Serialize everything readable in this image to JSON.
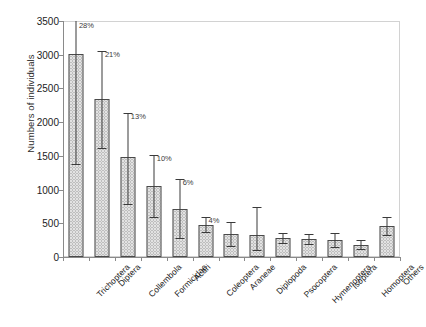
{
  "chart_data": {
    "type": "bar",
    "title": "",
    "xlabel": "",
    "ylabel": "Numbers of individuals",
    "ylim": [
      0,
      3500
    ],
    "ytick_labels": [
      "0",
      "500",
      "1000",
      "1500",
      "2000",
      "2500",
      "3000",
      "3500"
    ],
    "ytick_values": [
      0,
      500,
      1000,
      1500,
      2000,
      2500,
      3000,
      3500
    ],
    "grid": false,
    "legend": "none",
    "categories": [
      "Trichoptera",
      "Diptera",
      "Collembola",
      "Formicidae",
      "Acari",
      "Coleoptera",
      "Araneae",
      "Diplopoda",
      "Psocoptera",
      "Hymenoptera",
      "Isoptera",
      "Homoptera",
      "Others"
    ],
    "values": [
      3010,
      2340,
      1490,
      1050,
      710,
      480,
      340,
      320,
      280,
      265,
      250,
      175,
      455
    ],
    "error_low": [
      1380,
      1620,
      780,
      590,
      275,
      375,
      165,
      110,
      205,
      195,
      155,
      120,
      330
    ],
    "error_high": [
      3760,
      3060,
      2130,
      1520,
      1160,
      600,
      520,
      745,
      360,
      345,
      355,
      245,
      590
    ],
    "annotations": [
      {
        "category": "Trichoptera",
        "label": "28%"
      },
      {
        "category": "Diptera",
        "label": "21%"
      },
      {
        "category": "Collembola",
        "label": "13%"
      },
      {
        "category": "Formicidae",
        "label": "10%"
      },
      {
        "category": "Acari",
        "label": "6%"
      },
      {
        "category": "Coleoptera",
        "label": "4%"
      }
    ],
    "colors": {
      "bar_fill": "#e2e2e2",
      "bar_pattern": "#9a9a9a",
      "bar_edge": "#4a4a4a",
      "error_bar": "#3a3a3a",
      "axis": "#8a8a8a",
      "frame": "#d2d2d2",
      "text": "#1c1c1c"
    }
  }
}
